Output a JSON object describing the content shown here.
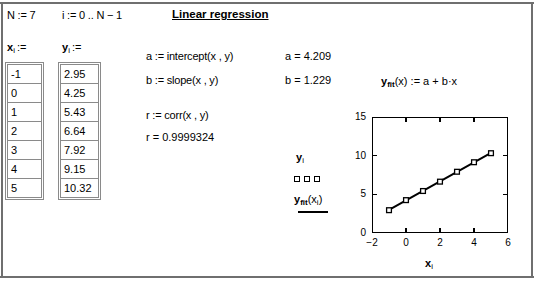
{
  "header": {
    "n_def": "N := 7",
    "i_def": "i := 0 .. N − 1",
    "title": "Linear regression"
  },
  "tables": {
    "x_label_base": "x",
    "x_label_sub": "i",
    "x_label_assign": ":=",
    "y_label_base": "y",
    "y_label_sub": "i",
    "y_label_assign": ":=",
    "x_values": [
      "-1",
      "0",
      "1",
      "2",
      "3",
      "4",
      "5"
    ],
    "y_values": [
      "2.95",
      "4.25",
      "5.43",
      "6.64",
      "7.92",
      "9.15",
      "10.32"
    ]
  },
  "formulas": {
    "a_def": "a := intercept(x , y)",
    "a_val": "a = 4.209",
    "b_def": "b := slope(x , y)",
    "b_val": "b = 1.229",
    "r_def": "r := corr(x , y)",
    "r_val": "r = 0.9999324",
    "yfit_base": "y",
    "yfit_sub": "fit",
    "yfit_rest": "(x) := a + b·x"
  },
  "legend": {
    "series1_base": "y",
    "series1_sub": "i",
    "series2_base": "y",
    "series2_sub": "fit",
    "series2_rest": "(x",
    "series2_sub2": "i",
    "series2_close": ")"
  },
  "chart_data": {
    "type": "scatter",
    "title": "",
    "xlabel": "x_i",
    "ylabel": "y_i",
    "xlabel_base": "x",
    "xlabel_sub": "i",
    "xlim": [
      -2,
      6
    ],
    "ylim": [
      0,
      15
    ],
    "xticks": [
      -2,
      0,
      2,
      4,
      6
    ],
    "yticks": [
      0,
      5,
      10,
      15
    ],
    "xticklabels": [
      "−2",
      "0",
      "2",
      "4",
      "6"
    ],
    "yticklabels": [
      "0",
      "5",
      "10",
      "15"
    ],
    "grid": false,
    "legend_position": "left-outside",
    "x": [
      -1,
      0,
      1,
      2,
      3,
      4,
      5
    ],
    "series": [
      {
        "name": "y_i",
        "style": "markers",
        "marker": "square",
        "values": [
          2.95,
          4.25,
          5.43,
          6.64,
          7.92,
          9.15,
          10.32
        ]
      },
      {
        "name": "y_fit(x_i)",
        "style": "line",
        "intercept": 4.209,
        "slope": 1.229,
        "values": [
          2.98,
          4.209,
          5.438,
          6.667,
          7.896,
          9.125,
          10.354
        ]
      }
    ]
  },
  "colors": {
    "ink": "#000000",
    "rule": "#6f6f6f",
    "cell_border": "#8a8a8a",
    "background": "#ffffff"
  }
}
